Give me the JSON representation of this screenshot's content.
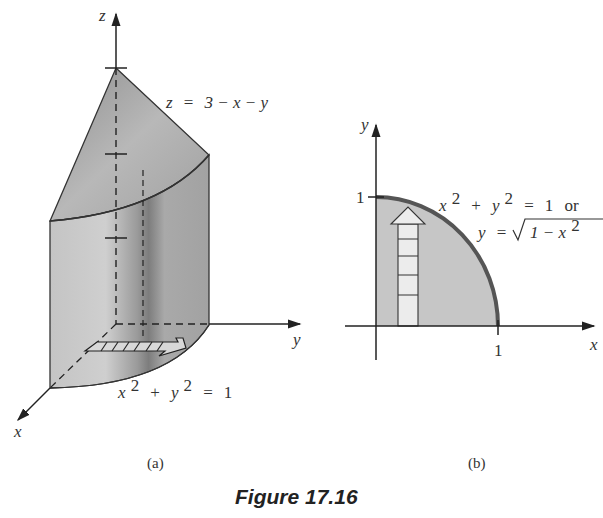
{
  "figure": {
    "caption": "Figure 17.16",
    "panels": [
      {
        "label": "(a)",
        "type": "3d-solid",
        "axes": {
          "x": "x",
          "y": "y",
          "z": "z"
        },
        "surface_label": "z = 3 − x − y",
        "surface": {
          "lhs": "z",
          "eq": "=",
          "rhs": "3 − x − y"
        },
        "base_curve_label": {
          "x": "x",
          "xexp": "2",
          "plus": "+",
          "y": "y",
          "yexp": "2",
          "eq": "=",
          "one": "1"
        },
        "z_ticks": 3
      },
      {
        "label": "(b)",
        "type": "2d-region",
        "axes": {
          "x": "x",
          "y": "y"
        },
        "tick_x": "1",
        "tick_y": "1",
        "curve_label_line1": {
          "x": "x",
          "xexp": "2",
          "plus": "+",
          "y": "y",
          "yexp": "2",
          "eq": "=",
          "one": "1",
          "or": "or"
        },
        "curve_label_line2": {
          "y": "y",
          "eq": "=",
          "rad": "1 − x",
          "exp": "2"
        }
      }
    ],
    "colors": {
      "solid_light": "#c8c8c8",
      "solid_mid": "#a8a8a8",
      "solid_dark": "#7a7a7a",
      "region_fill": "#c6c6c6",
      "curve": "#555555",
      "strip_fill": "#ececec",
      "axis": "#222222"
    }
  }
}
